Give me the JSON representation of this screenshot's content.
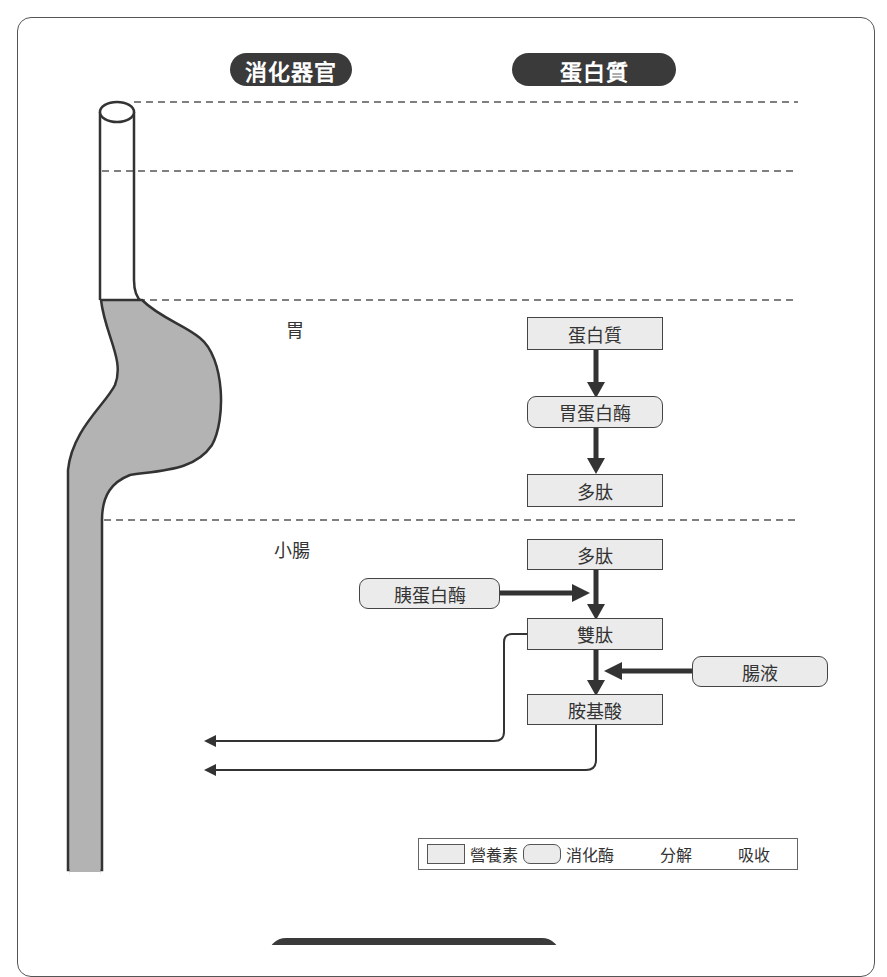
{
  "header": {
    "organ_column_title": "消化器官",
    "nutrient_column_title": "蛋白質"
  },
  "organs": [
    {
      "id": "stomach",
      "label": "胃"
    },
    {
      "id": "small_intestine",
      "label": "小腸"
    }
  ],
  "stomach_flow": {
    "nutrient_top": "蛋白質",
    "enzyme": "胃蛋白酶",
    "nutrient_bottom": "多肽"
  },
  "intestine_flow": {
    "nutrient_top": "多肽",
    "enzyme_left": "胰蛋白酶",
    "nutrient_middle": "雙肽",
    "enzyme_right": "腸液",
    "nutrient_bottom": "胺基酸"
  },
  "legend": {
    "nutrient": "營養素",
    "enzyme": "消化酶",
    "decompose": "分解",
    "absorb": "吸收"
  },
  "colors": {
    "pill_bg": "#3a3a3a",
    "organ_fill": "#b3b3b3",
    "box_fill": "#ebebeb",
    "stroke": "#333333"
  }
}
